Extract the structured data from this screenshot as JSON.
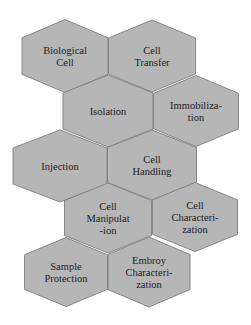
{
  "diagram": {
    "type": "hexagon-honeycomb",
    "colors": {
      "background": "#ffffff",
      "hex_fill": "#b6b6b6",
      "hex_stroke": "#7e7e7e",
      "text": "#222222"
    },
    "hexagons": [
      {
        "id": "biological-cell",
        "lines": [
          "Biological",
          "Cell"
        ],
        "cx": 65,
        "cy": 56,
        "w": 86,
        "h": 73
      },
      {
        "id": "cell-transfer",
        "lines": [
          "Cell",
          "Transfer"
        ],
        "cx": 152,
        "cy": 56,
        "w": 87,
        "h": 72
      },
      {
        "id": "isolation",
        "lines": [
          "Isolation"
        ],
        "cx": 108,
        "cy": 111,
        "w": 90,
        "h": 72
      },
      {
        "id": "immobilization",
        "lines": [
          "Immobiliza-",
          "tion"
        ],
        "cx": 196,
        "cy": 111,
        "w": 85,
        "h": 71
      },
      {
        "id": "injection",
        "lines": [
          "Injection"
        ],
        "cx": 60,
        "cy": 166,
        "w": 94,
        "h": 72
      },
      {
        "id": "cell-handling",
        "lines": [
          "Cell",
          "Handling"
        ],
        "cx": 152,
        "cy": 165,
        "w": 89,
        "h": 70
      },
      {
        "id": "cell-manipulation",
        "lines": [
          "Cell",
          "Manipulat",
          "-ion"
        ],
        "cx": 108,
        "cy": 218,
        "w": 87,
        "h": 70
      },
      {
        "id": "cell-characterization",
        "lines": [
          "Cell",
          "Characteri-",
          "zation"
        ],
        "cx": 195,
        "cy": 217,
        "w": 85,
        "h": 69
      },
      {
        "id": "sample-protection",
        "lines": [
          "Sample",
          "Protection"
        ],
        "cx": 66,
        "cy": 272,
        "w": 83,
        "h": 69
      },
      {
        "id": "embroy-characterization",
        "lines": [
          "Embroy",
          "Characteri-",
          "zation"
        ],
        "cx": 149,
        "cy": 272,
        "w": 82,
        "h": 70
      }
    ]
  }
}
